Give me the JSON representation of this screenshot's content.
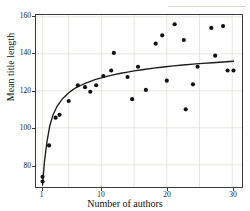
{
  "chart_data": {
    "type": "scatter",
    "title": "",
    "xlabel": "Number of authors",
    "ylabel": "Mean title length",
    "xlim": [
      0,
      31.5
    ],
    "ylim": [
      68,
      161
    ],
    "xticks": [
      1,
      10,
      20,
      30
    ],
    "yticks": [
      80,
      100,
      120,
      140,
      160
    ],
    "grid": true,
    "legend": null,
    "marker_color": "#111111",
    "curve_color": "#1a1a1a",
    "axis_color": "#3a3a3a",
    "grid_color": "#e2ded7",
    "points": [
      {
        "x": 1,
        "y": 71
      },
      {
        "x": 1,
        "y": 73.5
      },
      {
        "x": 2,
        "y": 90.5
      },
      {
        "x": 3,
        "y": 105.5
      },
      {
        "x": 3.6,
        "y": 107
      },
      {
        "x": 5,
        "y": 114.5
      },
      {
        "x": 6.4,
        "y": 123
      },
      {
        "x": 7.5,
        "y": 122
      },
      {
        "x": 8.3,
        "y": 119.5
      },
      {
        "x": 9.2,
        "y": 123
      },
      {
        "x": 10.3,
        "y": 128
      },
      {
        "x": 11.5,
        "y": 131
      },
      {
        "x": 11.9,
        "y": 140.5
      },
      {
        "x": 14,
        "y": 127.5
      },
      {
        "x": 15.6,
        "y": 133
      },
      {
        "x": 14.7,
        "y": 115.5
      },
      {
        "x": 16.8,
        "y": 120.5
      },
      {
        "x": 18.3,
        "y": 145.5
      },
      {
        "x": 19.3,
        "y": 150
      },
      {
        "x": 20,
        "y": 125.5
      },
      {
        "x": 21.2,
        "y": 156
      },
      {
        "x": 22.6,
        "y": 147.5
      },
      {
        "x": 22.9,
        "y": 110
      },
      {
        "x": 24,
        "y": 123.5
      },
      {
        "x": 24.7,
        "y": 133
      },
      {
        "x": 26.8,
        "y": 154
      },
      {
        "x": 27.4,
        "y": 139
      },
      {
        "x": 28.6,
        "y": 155
      },
      {
        "x": 29.3,
        "y": 131
      },
      {
        "x": 30.2,
        "y": 131
      }
    ],
    "fit_curve": {
      "form": "logarithmic",
      "description": "Fitted trend rising steeply from ~70 at 1 author, flattening near 136 by 30 authors",
      "points": [
        {
          "x": 1,
          "y": 69
        },
        {
          "x": 1.3,
          "y": 82
        },
        {
          "x": 1.7,
          "y": 93
        },
        {
          "x": 2.1,
          "y": 101
        },
        {
          "x": 2.6,
          "y": 107
        },
        {
          "x": 3.2,
          "y": 111.5
        },
        {
          "x": 4,
          "y": 115.5
        },
        {
          "x": 5,
          "y": 119
        },
        {
          "x": 6,
          "y": 121.5
        },
        {
          "x": 7.5,
          "y": 124
        },
        {
          "x": 9,
          "y": 126
        },
        {
          "x": 11,
          "y": 128
        },
        {
          "x": 13,
          "y": 129.5
        },
        {
          "x": 15,
          "y": 130.8
        },
        {
          "x": 18,
          "y": 132.3
        },
        {
          "x": 21,
          "y": 133.5
        },
        {
          "x": 24,
          "y": 134.4
        },
        {
          "x": 27,
          "y": 135.2
        },
        {
          "x": 30.2,
          "y": 136
        }
      ]
    }
  }
}
